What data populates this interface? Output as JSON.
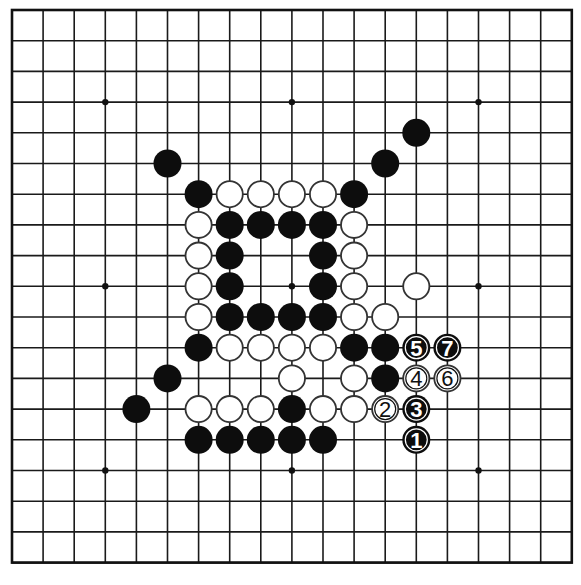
{
  "board": {
    "size": 19,
    "origin_x": 12,
    "origin_y": 10,
    "spacing_x": 31.1,
    "spacing_y": 30.7,
    "stone_radius": 14,
    "star_points": [
      [
        3,
        3
      ],
      [
        9,
        3
      ],
      [
        15,
        3
      ],
      [
        3,
        9
      ],
      [
        9,
        9
      ],
      [
        15,
        9
      ],
      [
        3,
        15
      ],
      [
        9,
        15
      ],
      [
        15,
        15
      ]
    ],
    "colors": {
      "line": "#1a1a1a",
      "black": "#0d0d0d",
      "white": "#ffffff",
      "background": "#ffffff"
    }
  },
  "stones": {
    "black": [
      [
        13,
        4
      ],
      [
        5,
        5
      ],
      [
        12,
        5
      ],
      [
        6,
        6
      ],
      [
        11,
        6
      ],
      [
        7,
        7
      ],
      [
        8,
        7
      ],
      [
        9,
        7
      ],
      [
        10,
        7
      ],
      [
        7,
        8
      ],
      [
        10,
        8
      ],
      [
        7,
        9
      ],
      [
        10,
        9
      ],
      [
        7,
        10
      ],
      [
        8,
        10
      ],
      [
        9,
        10
      ],
      [
        10,
        10
      ],
      [
        6,
        11
      ],
      [
        11,
        11
      ],
      [
        12,
        11
      ],
      [
        5,
        12
      ],
      [
        12,
        12
      ],
      [
        4,
        13
      ],
      [
        9,
        13
      ],
      [
        6,
        14
      ],
      [
        7,
        14
      ],
      [
        8,
        14
      ],
      [
        9,
        14
      ],
      [
        10,
        14
      ]
    ],
    "white": [
      [
        7,
        6
      ],
      [
        8,
        6
      ],
      [
        9,
        6
      ],
      [
        10,
        6
      ],
      [
        6,
        7
      ],
      [
        11,
        7
      ],
      [
        6,
        8
      ],
      [
        11,
        8
      ],
      [
        6,
        9
      ],
      [
        11,
        9
      ],
      [
        13,
        9
      ],
      [
        6,
        10
      ],
      [
        11,
        10
      ],
      [
        12,
        10
      ],
      [
        7,
        11
      ],
      [
        8,
        11
      ],
      [
        9,
        11
      ],
      [
        10,
        11
      ],
      [
        9,
        12
      ],
      [
        11,
        12
      ],
      [
        6,
        13
      ],
      [
        7,
        13
      ],
      [
        8,
        13
      ],
      [
        10,
        13
      ],
      [
        11,
        13
      ]
    ]
  },
  "moves": [
    {
      "number": "1",
      "color": "black",
      "col": 13,
      "row": 14
    },
    {
      "number": "2",
      "color": "white",
      "col": 12,
      "row": 13
    },
    {
      "number": "3",
      "color": "black",
      "col": 13,
      "row": 13
    },
    {
      "number": "4",
      "color": "white",
      "col": 13,
      "row": 12
    },
    {
      "number": "5",
      "color": "black",
      "col": 13,
      "row": 11
    },
    {
      "number": "6",
      "color": "white",
      "col": 14,
      "row": 12
    },
    {
      "number": "7",
      "color": "black",
      "col": 14,
      "row": 11
    }
  ]
}
